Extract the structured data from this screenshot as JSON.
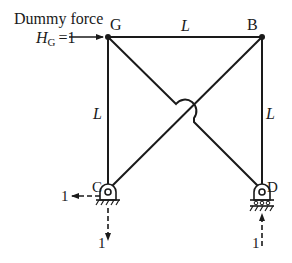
{
  "diagram": {
    "type": "frame-dummy-load",
    "annotation": {
      "line1": "Dummy force",
      "force_symbol": "H",
      "force_subscript": "G",
      "force_value": "=1"
    },
    "nodes": {
      "G": "G",
      "B": "B",
      "C": "C",
      "D": "D"
    },
    "members": {
      "top_length": "L",
      "left_length": "L",
      "right_length": "L"
    },
    "reactions": {
      "C_horizontal": "1",
      "C_vertical": "1",
      "D_vertical": "1"
    },
    "colors": {
      "line": "#1a1a1a",
      "background": "#ffffff"
    }
  }
}
